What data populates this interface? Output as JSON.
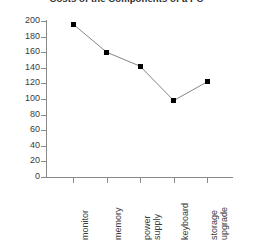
{
  "chart_data": {
    "type": "line",
    "title": "Costs of the Components of a PC",
    "xlabel": "",
    "ylabel": "",
    "categories": [
      "monitor",
      "memory",
      "power supply",
      "keyboard",
      "storage upgrade"
    ],
    "values": [
      196,
      160,
      142,
      98,
      122
    ],
    "ylim": [
      0,
      200
    ],
    "ytick_labels": [
      "200",
      "180",
      "160",
      "140",
      "120",
      "100",
      "80",
      "60",
      "40",
      "20",
      "0"
    ],
    "ytick_values": [
      200,
      180,
      160,
      140,
      120,
      100,
      80,
      60,
      40,
      20,
      0
    ],
    "grid": false,
    "legend": "none",
    "marker": "square",
    "marker_color": "#000000",
    "line_color": "#777777",
    "axis_color": "#8a8a8a"
  },
  "categories_wrapped": [
    [
      "monitor"
    ],
    [
      "memory"
    ],
    [
      "power",
      "supply"
    ],
    [
      "keyboard"
    ],
    [
      "storage",
      "upgrade"
    ]
  ]
}
